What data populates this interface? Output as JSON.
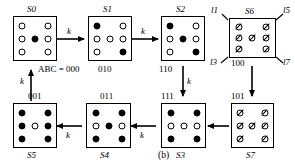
{
  "figure": {
    "caption": "(b)",
    "transition_label": "k",
    "input_label": "ABC = 000"
  },
  "states": [
    {
      "id": "S0",
      "name": "S0",
      "code": "000",
      "code_text": "ABC = 000",
      "cells": [
        "open",
        "open",
        "open",
        "open",
        "filled",
        "open",
        "open",
        "open",
        "open"
      ],
      "style": "dots"
    },
    {
      "id": "S1",
      "name": "S1",
      "code": "010",
      "cells": [
        "filled",
        "open",
        "open",
        "open",
        "open",
        "open",
        "open",
        "open",
        "filled"
      ],
      "style": "dots"
    },
    {
      "id": "S2",
      "name": "S2",
      "code": "110",
      "cells": [
        "filled",
        "open",
        "open",
        "open",
        "filled",
        "open",
        "open",
        "open",
        "filled"
      ],
      "style": "dots"
    },
    {
      "id": "S3",
      "name": "S3",
      "code": "111",
      "cells": [
        "filled",
        "open",
        "filled",
        "open",
        "open",
        "open",
        "filled",
        "open",
        "filled"
      ],
      "style": "dots"
    },
    {
      "id": "S4",
      "name": "S4",
      "code": "011",
      "cells": [
        "filled",
        "open",
        "filled",
        "open",
        "filled",
        "open",
        "filled",
        "open",
        "filled"
      ],
      "style": "dots"
    },
    {
      "id": "S5",
      "name": "S5",
      "code": "001",
      "cells": [
        "filled",
        "filled",
        "filled",
        "filled",
        "open",
        "filled",
        "filled",
        "filled",
        "filled"
      ],
      "style": "dots"
    },
    {
      "id": "S6",
      "name": "S6",
      "code": "100",
      "cells": [
        "slash",
        "open",
        "slash",
        "slash",
        "slash",
        "slash",
        "slash",
        "open",
        "slash"
      ],
      "style": "slashed"
    },
    {
      "id": "S7",
      "name": "S7",
      "code": "101",
      "cells": [
        "slash",
        "open",
        "slash",
        "slash",
        "slash",
        "slash",
        "slash",
        "open",
        "slash"
      ],
      "style": "slashed"
    }
  ],
  "corner_labels": {
    "top_left": "l1",
    "top_right": "l5",
    "bottom_left": "l3",
    "bottom_right": "l7"
  },
  "transitions": [
    {
      "from": "S0",
      "to": "S1",
      "label": "k"
    },
    {
      "from": "S1",
      "to": "S2",
      "label": "k"
    },
    {
      "from": "S2",
      "to": "S3",
      "label": "k"
    },
    {
      "from": "S3",
      "to": "S4",
      "label": "k"
    },
    {
      "from": "S4",
      "to": "S5",
      "label": "k"
    },
    {
      "from": "S5",
      "to": "S0",
      "label": "k"
    },
    {
      "from": "S6",
      "to": "S7",
      "label": ""
    },
    {
      "from": "S7",
      "to": "S3",
      "label": ""
    }
  ]
}
